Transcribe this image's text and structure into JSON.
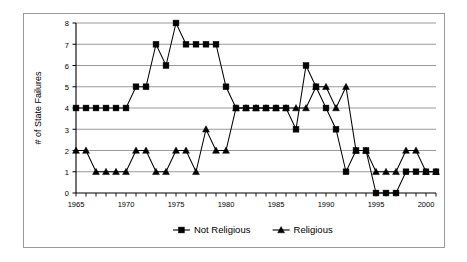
{
  "chart_data": {
    "type": "line",
    "title": "",
    "xlabel": "",
    "ylabel": "# of State Failures",
    "xlim": [
      1965,
      2001
    ],
    "ylim": [
      0,
      8
    ],
    "ytick_values": [
      0,
      1,
      2,
      3,
      4,
      5,
      6,
      7,
      8
    ],
    "ytick_labels": [
      "0",
      "1",
      "2",
      "3",
      "4",
      "5",
      "6",
      "7",
      "8"
    ],
    "xtick_labels": [
      "1965",
      "1970",
      "1975",
      "1980",
      "1985",
      "1990",
      "1995",
      "2000"
    ],
    "xtick_values": [
      1965,
      1970,
      1975,
      1980,
      1985,
      1990,
      1995,
      2000
    ],
    "x": [
      1965,
      1966,
      1967,
      1968,
      1969,
      1970,
      1971,
      1972,
      1973,
      1974,
      1975,
      1976,
      1977,
      1978,
      1979,
      1980,
      1981,
      1982,
      1983,
      1984,
      1985,
      1986,
      1987,
      1988,
      1989,
      1990,
      1991,
      1992,
      1993,
      1994,
      1995,
      1996,
      1997,
      1998,
      1999,
      2000,
      2001
    ],
    "grid": true,
    "grid_axis": "y",
    "legend_position": "bottom",
    "series": [
      {
        "name": "Not Religious",
        "marker": "square",
        "color": "#000000",
        "values": [
          4,
          4,
          4,
          4,
          4,
          4,
          5,
          5,
          7,
          6,
          8,
          7,
          7,
          7,
          7,
          5,
          4,
          4,
          4,
          4,
          4,
          4,
          3,
          6,
          5,
          4,
          3,
          1,
          2,
          2,
          0,
          0,
          0,
          1,
          1,
          1,
          1
        ]
      },
      {
        "name": "Religious",
        "marker": "triangle",
        "color": "#000000",
        "values": [
          2,
          2,
          1,
          1,
          1,
          1,
          2,
          2,
          1,
          1,
          2,
          2,
          1,
          3,
          2,
          2,
          4,
          4,
          4,
          4,
          4,
          4,
          4,
          4,
          5,
          5,
          4,
          5,
          2,
          2,
          1,
          1,
          1,
          2,
          2,
          1,
          1
        ]
      }
    ]
  },
  "legend": {
    "items": [
      {
        "label": "Not Religious",
        "marker": "square"
      },
      {
        "label": "Religious",
        "marker": "triangle"
      }
    ]
  }
}
